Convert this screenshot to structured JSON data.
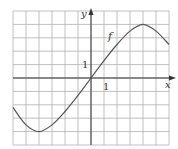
{
  "chart_data": {
    "type": "line",
    "title": "",
    "xlabel": "x",
    "ylabel": "y",
    "curve_label": "f",
    "xlim": [
      -6,
      6
    ],
    "ylim": [
      -5,
      5
    ],
    "grid": true,
    "tick_labels": {
      "x": "1",
      "y": "1"
    },
    "series": [
      {
        "name": "f",
        "x": [
          -6,
          -5,
          -4,
          -3,
          -2,
          -1,
          0,
          1,
          2,
          3,
          4,
          5,
          6
        ],
        "values": [
          -2.2,
          -3.5,
          -4,
          -3.5,
          -2.5,
          -1.3,
          0,
          1.3,
          2.5,
          3.5,
          4,
          3.5,
          2.5
        ]
      }
    ],
    "colors": {
      "curve": "#555555",
      "grid": "#b0b0b0",
      "axis": "#333333"
    }
  }
}
